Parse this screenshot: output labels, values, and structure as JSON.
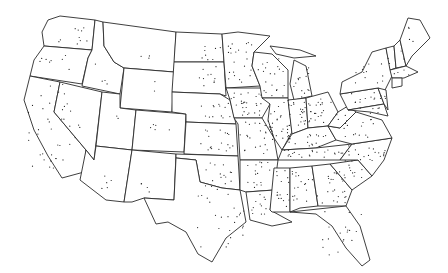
{
  "map": {
    "type": "dot-distribution",
    "region": "Contiguous United States",
    "colors": {
      "background": "#ffffff",
      "outline": "#2a2a2a",
      "dot": "#222222"
    },
    "states": [
      {
        "id": "WA",
        "d": "M60,16 L95,20 L92,50 L44,46 L42,32 L48,20 Z"
      },
      {
        "id": "OR",
        "d": "M44,46 L92,50 L88,58 L82,84 L30,76 L34,60 Z"
      },
      {
        "id": "CA",
        "d": "M30,76 L60,82 L54,112 L86,150 L84,172 L62,178 L48,156 L34,130 L24,100 Z"
      },
      {
        "id": "ID",
        "d": "M95,20 L103,22 L104,46 L114,62 L124,68 L120,94 L82,86 L88,58 L92,50 Z"
      },
      {
        "id": "NV",
        "d": "M60,82 L102,92 L94,160 L86,150 L54,112 Z"
      },
      {
        "id": "MT",
        "d": "M103,22 L176,32 L174,72 L124,68 L114,62 L104,46 Z"
      },
      {
        "id": "WY",
        "d": "M124,68 L174,72 L172,112 L120,108 Z"
      },
      {
        "id": "UT",
        "d": "M102,92 L120,94 L120,108 L136,110 L132,150 L96,146 Z"
      },
      {
        "id": "CO",
        "d": "M136,110 L186,114 L184,152 L132,150 Z"
      },
      {
        "id": "AZ",
        "d": "M96,146 L132,150 L124,202 L106,200 L80,180 L86,150 L94,160 Z"
      },
      {
        "id": "NM",
        "d": "M132,150 L176,154 L174,200 L144,198 L132,202 L124,202 Z"
      },
      {
        "id": "ND",
        "d": "M176,32 L222,34 L224,62 L174,62 Z"
      },
      {
        "id": "SD",
        "d": "M174,62 L224,62 L226,96 L220,94 L172,92 Z"
      },
      {
        "id": "NE",
        "d": "M172,92 L220,94 L230,100 L236,124 L186,122 L186,114 L172,112 Z"
      },
      {
        "id": "KS",
        "d": "M186,122 L236,124 L238,156 L184,154 Z"
      },
      {
        "id": "OK",
        "d": "M176,154 L238,156 L240,190 L222,188 L200,182 L196,160 L176,158 Z"
      },
      {
        "id": "TX",
        "d": "M176,158 L196,160 L200,182 L222,188 L240,190 L246,222 L226,238 L212,262 L198,254 L186,232 L168,222 L156,224 L144,198 L174,200 Z"
      },
      {
        "id": "MN",
        "d": "M222,34 L238,32 L270,36 L254,52 L252,66 L260,86 L226,88 L224,62 Z"
      },
      {
        "id": "IA",
        "d": "M226,88 L262,88 L270,104 L262,118 L234,118 L230,100 Z"
      },
      {
        "id": "MO",
        "d": "M234,118 L262,118 L274,138 L278,160 L240,160 L238,124 Z"
      },
      {
        "id": "AR",
        "d": "M240,160 L278,160 L274,190 L246,192 L240,190 Z"
      },
      {
        "id": "LA",
        "d": "M246,192 L274,190 L270,210 L292,222 L272,226 L250,220 Z"
      },
      {
        "id": "WI",
        "d": "M254,52 L272,54 L288,70 L288,98 L262,98 L260,86 L252,66 Z"
      },
      {
        "id": "IL",
        "d": "M262,98 L288,98 L292,132 L282,150 L274,138 L268,120 L270,104 Z"
      },
      {
        "id": "MI",
        "d": "M294,60 L306,66 L312,96 L294,100 L290,84 Z M270,46 L300,50 L316,56 L294,58 L276,54 Z"
      },
      {
        "id": "IN",
        "d": "M288,100 L306,98 L308,128 L292,134 Z"
      },
      {
        "id": "OH",
        "d": "M306,98 L328,92 L338,112 L328,126 L308,128 Z"
      },
      {
        "id": "KY",
        "d": "M282,150 L292,134 L308,128 L328,126 L336,140 L316,148 Z"
      },
      {
        "id": "TN",
        "d": "M278,160 L282,150 L316,148 L352,144 L340,160 Z"
      },
      {
        "id": "MS",
        "d": "M274,168 L290,168 L290,212 L272,212 L270,210 Z"
      },
      {
        "id": "AL",
        "d": "M290,168 L312,166 L318,206 L300,208 L290,212 Z"
      },
      {
        "id": "GA",
        "d": "M312,166 L330,164 L352,190 L346,206 L318,206 Z"
      },
      {
        "id": "FL",
        "d": "M290,212 L346,206 L360,226 L370,260 L362,266 L346,248 L332,226 L316,214 Z"
      },
      {
        "id": "SC",
        "d": "M330,164 L358,160 L372,176 L352,190 Z"
      },
      {
        "id": "NC",
        "d": "M340,160 L352,144 L392,138 L384,160 L372,176 L358,160 Z"
      },
      {
        "id": "VA",
        "d": "M328,126 L340,128 L356,112 L382,120 L392,138 L352,144 L336,140 Z"
      },
      {
        "id": "WV",
        "d": "M328,126 L338,112 L348,106 L356,112 L340,128 Z"
      },
      {
        "id": "PA",
        "d": "M340,94 L378,88 L384,104 L348,110 Z"
      },
      {
        "id": "NY",
        "d": "M342,82 L362,72 L372,52 L386,48 L392,76 L384,92 L378,88 L340,94 Z"
      },
      {
        "id": "MD",
        "d": "M348,110 L384,104 L388,116 L370,112 Z"
      },
      {
        "id": "NJ",
        "d": "M378,88 L386,90 L388,110 L384,104 Z"
      },
      {
        "id": "VT",
        "d": "M386,48 L394,46 L396,68 L390,70 Z"
      },
      {
        "id": "NH",
        "d": "M394,46 L400,40 L406,66 L396,68 Z"
      },
      {
        "id": "ME",
        "d": "M400,40 L408,18 L420,20 L430,38 L412,56 L406,66 Z"
      },
      {
        "id": "MA",
        "d": "M390,70 L406,66 L418,72 L404,78 L392,78 Z"
      },
      {
        "id": "CT",
        "d": "M392,78 L402,78 L402,86 L392,88 Z"
      }
    ],
    "dot_regions": [
      {
        "state": "WA",
        "count": 10,
        "box": [
          52,
          24,
          92,
          44
        ]
      },
      {
        "state": "OR",
        "count": 8,
        "box": [
          36,
          52,
          72,
          72
        ]
      },
      {
        "state": "CA",
        "count": 40,
        "box": [
          28,
          84,
          80,
          172
        ]
      },
      {
        "state": "ID",
        "count": 4,
        "box": [
          88,
          64,
          112,
          84
        ]
      },
      {
        "state": "MT",
        "count": 3,
        "box": [
          136,
          50,
          156,
          62
        ]
      },
      {
        "state": "WY",
        "count": 2,
        "box": [
          144,
          80,
          160,
          92
        ]
      },
      {
        "state": "UT",
        "count": 2,
        "box": [
          110,
          114,
          122,
          124
        ]
      },
      {
        "state": "CO",
        "count": 5,
        "box": [
          148,
          120,
          170,
          134
        ]
      },
      {
        "state": "AZ",
        "count": 5,
        "box": [
          100,
          176,
          114,
          190
        ]
      },
      {
        "state": "NM",
        "count": 4,
        "box": [
          140,
          182,
          152,
          196
        ]
      },
      {
        "state": "ND",
        "count": 8,
        "box": [
          200,
          42,
          222,
          60
        ]
      },
      {
        "state": "SD",
        "count": 10,
        "box": [
          196,
          66,
          222,
          90
        ]
      },
      {
        "state": "NE",
        "count": 14,
        "box": [
          200,
          98,
          232,
          118
        ]
      },
      {
        "state": "KS",
        "count": 18,
        "box": [
          200,
          128,
          236,
          152
        ]
      },
      {
        "state": "OK",
        "count": 14,
        "box": [
          204,
          162,
          238,
          186
        ]
      },
      {
        "state": "TX",
        "count": 26,
        "box": [
          196,
          186,
          244,
          248
        ]
      },
      {
        "state": "MN",
        "count": 22,
        "box": [
          228,
          40,
          256,
          86
        ]
      },
      {
        "state": "IA",
        "count": 26,
        "box": [
          232,
          92,
          262,
          116
        ]
      },
      {
        "state": "MO",
        "count": 24,
        "box": [
          240,
          122,
          274,
          156
        ]
      },
      {
        "state": "AR",
        "count": 16,
        "box": [
          246,
          162,
          272,
          188
        ]
      },
      {
        "state": "LA",
        "count": 12,
        "box": [
          250,
          194,
          268,
          218
        ]
      },
      {
        "state": "WI",
        "count": 20,
        "box": [
          258,
          58,
          286,
          96
        ]
      },
      {
        "state": "IL",
        "count": 26,
        "box": [
          266,
          100,
          290,
          140
        ]
      },
      {
        "state": "MI",
        "count": 14,
        "box": [
          292,
          66,
          310,
          98
        ]
      },
      {
        "state": "IN",
        "count": 18,
        "box": [
          290,
          102,
          306,
          128
        ]
      },
      {
        "state": "OH",
        "count": 22,
        "box": [
          308,
          98,
          334,
          124
        ]
      },
      {
        "state": "KY",
        "count": 18,
        "box": [
          288,
          134,
          330,
          148
        ]
      },
      {
        "state": "TN",
        "count": 22,
        "box": [
          284,
          150,
          344,
          158
        ]
      },
      {
        "state": "MS",
        "count": 16,
        "box": [
          274,
          170,
          290,
          208
        ]
      },
      {
        "state": "AL",
        "count": 18,
        "box": [
          292,
          170,
          314,
          204
        ]
      },
      {
        "state": "GA",
        "count": 22,
        "box": [
          316,
          170,
          346,
          204
        ]
      },
      {
        "state": "FL",
        "count": 18,
        "box": [
          320,
          210,
          364,
          256
        ]
      },
      {
        "state": "SC",
        "count": 12,
        "box": [
          336,
          164,
          364,
          180
        ]
      },
      {
        "state": "NC",
        "count": 22,
        "box": [
          344,
          144,
          388,
          164
        ]
      },
      {
        "state": "VA",
        "count": 14,
        "box": [
          344,
          118,
          384,
          138
        ]
      },
      {
        "state": "WV",
        "count": 4,
        "box": [
          334,
          112,
          346,
          124
        ]
      },
      {
        "state": "PA",
        "count": 10,
        "box": [
          346,
          92,
          378,
          106
        ]
      },
      {
        "state": "NY",
        "count": 12,
        "box": [
          350,
          62,
          384,
          86
        ]
      },
      {
        "state": "MD",
        "count": 6,
        "box": [
          358,
          106,
          380,
          114
        ]
      },
      {
        "state": "NJ",
        "count": 4,
        "box": [
          380,
          92,
          386,
          104
        ]
      },
      {
        "state": "VT",
        "count": 2,
        "box": [
          388,
          52,
          394,
          64
        ]
      },
      {
        "state": "NH",
        "count": 2,
        "box": [
          398,
          50,
          404,
          62
        ]
      },
      {
        "state": "ME",
        "count": 4,
        "box": [
          408,
          26,
          420,
          46
        ]
      },
      {
        "state": "MA",
        "count": 4,
        "box": [
          394,
          70,
          410,
          76
        ]
      }
    ]
  }
}
